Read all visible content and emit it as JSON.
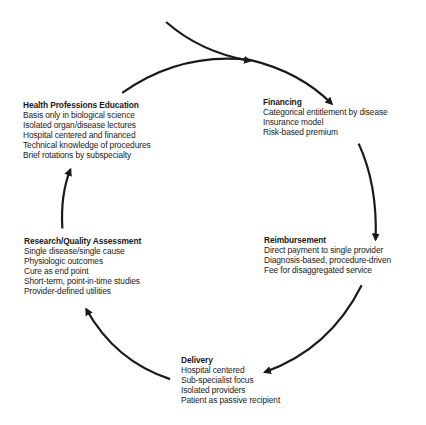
{
  "diagram": {
    "type": "cycle",
    "nodes": [
      {
        "id": "education",
        "title": "Health Professions Education",
        "items": [
          "Basis only in biological science",
          "Isolated organ/disease lectures",
          "Hospital centered and financed",
          "Technical knowledge of procedures",
          "Brief rotations by subspecialty"
        ]
      },
      {
        "id": "financing",
        "title": "Financing",
        "items": [
          "Categorical entitlement by disease",
          "Insurance model",
          "Risk-based premium"
        ]
      },
      {
        "id": "reimbursement",
        "title": "Reimbursement",
        "items": [
          "Direct payment to single provider",
          "Diagnosis-based, procedure-driven",
          "Fee for disaggregated service"
        ]
      },
      {
        "id": "delivery",
        "title": "Delivery",
        "items": [
          "Hospital centered",
          "Sub-specialist focus",
          "Isolated providers",
          "Patient as passive recipient"
        ]
      },
      {
        "id": "research",
        "title": "Research/Quality Assessment",
        "items": [
          "Single disease/single cause",
          "Physiologic outcomes",
          "Cure as end point",
          "Short-term, point-in-time studies",
          "Provider-defined utilities"
        ]
      }
    ],
    "edges": [
      {
        "from": "entry",
        "to": "financing"
      },
      {
        "from": "education",
        "to": "financing"
      },
      {
        "from": "financing",
        "to": "reimbursement"
      },
      {
        "from": "reimbursement",
        "to": "delivery"
      },
      {
        "from": "delivery",
        "to": "research"
      },
      {
        "from": "research",
        "to": "education"
      }
    ],
    "colors": {
      "stroke": "#1a1a1a",
      "background": "#ffffff"
    }
  }
}
